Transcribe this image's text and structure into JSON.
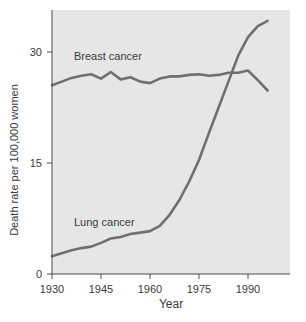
{
  "chart_data": {
    "type": "line",
    "title": "",
    "xlabel": "Year",
    "ylabel": "Death rate per 100,000 women",
    "xlim": [
      1930,
      1998
    ],
    "ylim": [
      0,
      36
    ],
    "xticks": [
      1930,
      1945,
      1960,
      1975,
      1990
    ],
    "yticks": [
      0,
      15,
      30
    ],
    "grid": false,
    "legend": "inline labels",
    "x": [
      1930,
      1933,
      1936,
      1939,
      1942,
      1945,
      1948,
      1951,
      1954,
      1957,
      1960,
      1963,
      1966,
      1969,
      1972,
      1975,
      1978,
      1981,
      1984,
      1987,
      1990,
      1993,
      1996
    ],
    "series": [
      {
        "name": "Breast cancer",
        "label_pos": [
          1937,
          28.9
        ],
        "values": [
          25.5,
          26.0,
          26.5,
          26.8,
          27.0,
          26.4,
          27.3,
          26.3,
          26.6,
          26.0,
          25.8,
          26.4,
          26.7,
          26.7,
          26.9,
          27.0,
          26.8,
          26.9,
          27.2,
          27.2,
          27.5,
          26.2,
          24.8
        ]
      },
      {
        "name": "Lung cancer",
        "label_pos": [
          1937,
          7.0
        ],
        "values": [
          2.4,
          2.8,
          3.2,
          3.5,
          3.7,
          4.2,
          4.8,
          5.0,
          5.4,
          5.6,
          5.8,
          6.5,
          8.0,
          10.0,
          12.5,
          15.4,
          19.0,
          22.5,
          26.0,
          29.5,
          32.0,
          33.5,
          34.2
        ]
      }
    ]
  },
  "axes": {
    "x_title": "Year",
    "y_title": "Death rate per 100,000 women",
    "x_tick_labels": [
      "1930",
      "1945",
      "1960",
      "1975",
      "1990"
    ],
    "y_tick_labels": [
      "0",
      "15",
      "30"
    ]
  },
  "series_labels": {
    "breast": "Breast cancer",
    "lung": "Lung cancer"
  },
  "colors": {
    "plot_bg": "#e6e6e6",
    "line": "#6f6f6f",
    "axis": "#4a4a4a",
    "text": "#3a3a3a"
  }
}
